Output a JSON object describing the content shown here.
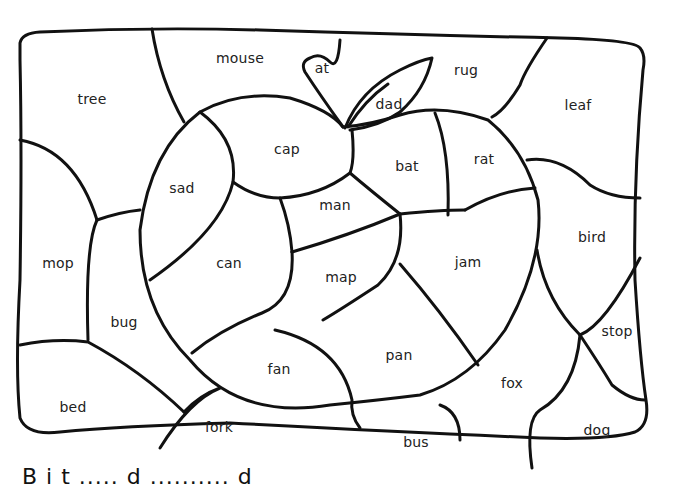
{
  "worksheet": {
    "type": "color-by-word puzzle",
    "picture": "apple with stem and leaf",
    "regions": [
      {
        "word": "mouse",
        "x": 240,
        "y": 58
      },
      {
        "word": "at",
        "x": 322,
        "y": 68
      },
      {
        "word": "rug",
        "x": 466,
        "y": 70
      },
      {
        "word": "tree",
        "x": 92,
        "y": 99
      },
      {
        "word": "dad",
        "x": 389,
        "y": 104
      },
      {
        "word": "leaf",
        "x": 578,
        "y": 105
      },
      {
        "word": "cap",
        "x": 287,
        "y": 149
      },
      {
        "word": "bat",
        "x": 407,
        "y": 166
      },
      {
        "word": "rat",
        "x": 484,
        "y": 159
      },
      {
        "word": "sad",
        "x": 182,
        "y": 188
      },
      {
        "word": "man",
        "x": 335,
        "y": 205
      },
      {
        "word": "bird",
        "x": 592,
        "y": 237
      },
      {
        "word": "mop",
        "x": 58,
        "y": 263
      },
      {
        "word": "can",
        "x": 229,
        "y": 263
      },
      {
        "word": "jam",
        "x": 468,
        "y": 262
      },
      {
        "word": "map",
        "x": 341,
        "y": 277
      },
      {
        "word": "bug",
        "x": 124,
        "y": 322
      },
      {
        "word": "stop",
        "x": 617,
        "y": 331
      },
      {
        "word": "pan",
        "x": 399,
        "y": 355
      },
      {
        "word": "fan",
        "x": 279,
        "y": 369
      },
      {
        "word": "fox",
        "x": 512,
        "y": 383
      },
      {
        "word": "bed",
        "x": 73,
        "y": 407
      },
      {
        "word": "fork",
        "x": 219,
        "y": 427
      },
      {
        "word": "dog",
        "x": 597,
        "y": 430
      },
      {
        "word": "bus",
        "x": 416,
        "y": 442
      }
    ]
  },
  "footer": {
    "text_partial": "B  i  t    .....    d    ..........    d"
  }
}
